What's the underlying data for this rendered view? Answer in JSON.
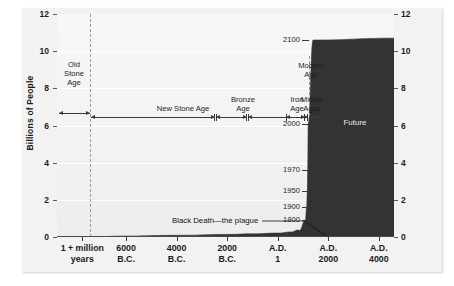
{
  "chart_data": {
    "type": "area",
    "xlabel": "",
    "ylabel": "Billions of People",
    "ylim": [
      0,
      12
    ],
    "grid": true,
    "legend": "none",
    "y_axis": {
      "left_ticks": [
        "12",
        "10",
        "8",
        "6",
        "4",
        "2",
        "0"
      ],
      "right_ticks": [
        "12",
        "10",
        "8",
        "6",
        "4",
        "2",
        "0"
      ],
      "values": [
        12,
        10,
        8,
        6,
        4,
        2,
        0
      ]
    },
    "x_axis": {
      "tick_labels": [
        "1 + million\nyears",
        "6000\nB.C.",
        "4000\nB.C.",
        "2000\nB.C.",
        "A.D.\n1",
        "A.D.\n2000",
        "A.D.\n4000"
      ]
    },
    "series": [
      {
        "name": "World population",
        "points": [
          {
            "year": "1,000,000 B.C.",
            "x_frac": 0.0,
            "value": 0.0
          },
          {
            "year": "8000 B.C.",
            "x_frac": 0.1,
            "value": 0.01
          },
          {
            "year": "6000 B.C.",
            "x_frac": 0.205,
            "value": 0.05
          },
          {
            "year": "4000 B.C.",
            "x_frac": 0.355,
            "value": 0.09
          },
          {
            "year": "2000 B.C.",
            "x_frac": 0.505,
            "value": 0.14
          },
          {
            "year": "1000 B.C.",
            "x_frac": 0.58,
            "value": 0.17
          },
          {
            "year": "A.D. 1",
            "x_frac": 0.655,
            "value": 0.21
          },
          {
            "year": "A.D. 1000",
            "x_frac": 0.695,
            "value": 0.27
          },
          {
            "year": "A.D. 1348 (Black Death)",
            "x_frac": 0.716,
            "value": 0.38
          },
          {
            "year": "A.D. 1400",
            "x_frac": 0.719,
            "value": 0.35
          },
          {
            "year": "A.D. 1800",
            "x_frac": 0.737,
            "value": 0.9
          },
          {
            "year": "A.D. 1900",
            "x_frac": 0.741,
            "value": 1.6
          },
          {
            "year": "A.D. 1950",
            "x_frac": 0.743,
            "value": 2.5
          },
          {
            "year": "A.D. 1970",
            "x_frac": 0.744,
            "value": 3.6
          },
          {
            "year": "A.D. 2000",
            "x_frac": 0.7455,
            "value": 6.1
          },
          {
            "year": "A.D. 2100",
            "x_frac": 0.76,
            "value": 10.6
          },
          {
            "year": "A.D. 4000",
            "x_frac": 1.0,
            "value": 10.7
          }
        ]
      }
    ],
    "year_markers": [
      {
        "label": "2100",
        "value": 10.6
      },
      {
        "label": "2000",
        "value": 6.1
      },
      {
        "label": "1970",
        "value": 3.6
      },
      {
        "label": "1950",
        "value": 2.5
      },
      {
        "label": "1900",
        "value": 1.6
      },
      {
        "label": "1800",
        "value": 0.9
      }
    ],
    "annotations": [
      {
        "name": "black-death",
        "text": "Black Death—the plague",
        "value": 0.75
      },
      {
        "name": "future-region",
        "text": "Future"
      }
    ],
    "eras": [
      {
        "name": "old-stone-age",
        "label": "Old\nStone\nAge"
      },
      {
        "name": "new-stone-age",
        "label": "New Stone Age"
      },
      {
        "name": "bronze-age",
        "label": "Bronze\nAge"
      },
      {
        "name": "iron-age",
        "label": "Iron\nAge"
      },
      {
        "name": "middle-ages",
        "label": "Middle\nAges"
      },
      {
        "name": "modern-age",
        "label": "Modern\nAge"
      }
    ],
    "colors": {
      "area_fill": "#333333",
      "plot_background": "#f0f0f0",
      "panel_background": "#f2f2f2",
      "axis": "#3a3a3a",
      "text": "#1a1a1a",
      "future_label": "#e8e8e8"
    }
  },
  "artifact": {
    "top_text": ""
  }
}
